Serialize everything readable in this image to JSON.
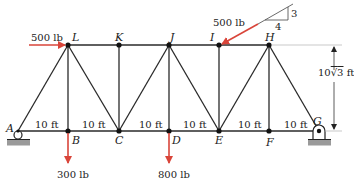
{
  "diagram": {
    "type": "truss",
    "joints": {
      "A": {
        "label": "A",
        "x": 18,
        "y": 131
      },
      "B": {
        "label": "B",
        "x": 68,
        "y": 131
      },
      "C": {
        "label": "C",
        "x": 119,
        "y": 131
      },
      "D": {
        "label": "D",
        "x": 169,
        "y": 131
      },
      "E": {
        "label": "E",
        "x": 219,
        "y": 131
      },
      "F": {
        "label": "F",
        "x": 269,
        "y": 131
      },
      "G": {
        "label": "G",
        "x": 319,
        "y": 131
      },
      "L": {
        "label": "L",
        "x": 68,
        "y": 45
      },
      "K": {
        "label": "K",
        "x": 119,
        "y": 45
      },
      "J": {
        "label": "J",
        "x": 169,
        "y": 45
      },
      "I": {
        "label": "I",
        "x": 219,
        "y": 45
      },
      "H": {
        "label": "H",
        "x": 269,
        "y": 45
      }
    },
    "members": [
      [
        "A",
        "B"
      ],
      [
        "B",
        "C"
      ],
      [
        "C",
        "D"
      ],
      [
        "D",
        "E"
      ],
      [
        "E",
        "F"
      ],
      [
        "F",
        "G"
      ],
      [
        "L",
        "K"
      ],
      [
        "K",
        "J"
      ],
      [
        "J",
        "I"
      ],
      [
        "I",
        "H"
      ],
      [
        "A",
        "L"
      ],
      [
        "L",
        "B"
      ],
      [
        "L",
        "C"
      ],
      [
        "K",
        "C"
      ],
      [
        "C",
        "J"
      ],
      [
        "J",
        "D"
      ],
      [
        "J",
        "E"
      ],
      [
        "I",
        "E"
      ],
      [
        "E",
        "H"
      ],
      [
        "H",
        "F"
      ],
      [
        "H",
        "G"
      ]
    ],
    "spans": [
      {
        "label": "10 ft"
      },
      {
        "label": "10 ft"
      },
      {
        "label": "10 ft"
      },
      {
        "label": "10 ft"
      },
      {
        "label": "10 ft"
      },
      {
        "label": "10 ft"
      }
    ],
    "height_label": "10√3 ft",
    "height_label_prefix": "10",
    "height_label_radicand": "3",
    "height_label_unit": "ft",
    "loads": [
      {
        "joint": "L",
        "label": "500 lb",
        "direction": "horizontal-right"
      },
      {
        "joint": "I",
        "label": "500 lb",
        "direction": "slope",
        "slope_rise": "3",
        "slope_run": "4"
      },
      {
        "joint": "B",
        "label": "300 lb",
        "direction": "down"
      },
      {
        "joint": "D",
        "label": "800 lb",
        "direction": "down"
      }
    ],
    "supports": [
      {
        "joint": "A",
        "type": "roller"
      },
      {
        "joint": "G",
        "type": "pin"
      }
    ],
    "colors": {
      "member": "#2a2a2a",
      "load": "#d9453a",
      "support_base": "#9a9a9a",
      "text": "#222222"
    }
  }
}
